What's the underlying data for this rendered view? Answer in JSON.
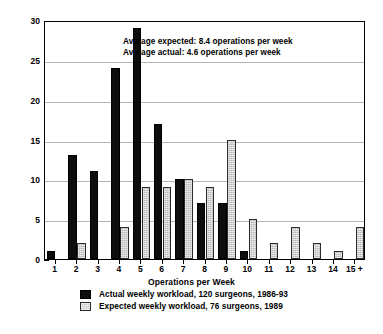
{
  "chart_data": {
    "type": "bar",
    "title": "",
    "xlabel": "Operations per Week",
    "ylabel": "Number of Consultants",
    "ylim": [
      0,
      30
    ],
    "yticks": [
      0,
      5,
      10,
      15,
      20,
      25,
      30
    ],
    "grid": true,
    "legend_position": "bottom-center",
    "categories": [
      "1",
      "2",
      "3",
      "4",
      "5",
      "6",
      "7",
      "8",
      "9",
      "10",
      "11",
      "12",
      "13",
      "14",
      "15 +"
    ],
    "series": [
      {
        "name": "Actual weekly workload, 120 surgeons, 1986-93",
        "color": "#0d0d0d",
        "values": [
          1,
          13,
          11,
          24,
          29,
          17,
          10,
          7,
          7,
          1,
          0,
          0,
          0,
          0,
          0
        ]
      },
      {
        "name": "Expected weekly workload, 76 surgeons, 1989",
        "color": "#b8b8b8",
        "values": [
          0,
          2,
          0,
          4,
          9,
          9,
          10,
          9,
          15,
          5,
          2,
          4,
          2,
          1,
          4
        ]
      }
    ],
    "annotations": [
      "Average expected: 8.4 operations per week",
      "Average actual: 4.6 operations per week"
    ]
  },
  "figure": {
    "caption": ""
  }
}
